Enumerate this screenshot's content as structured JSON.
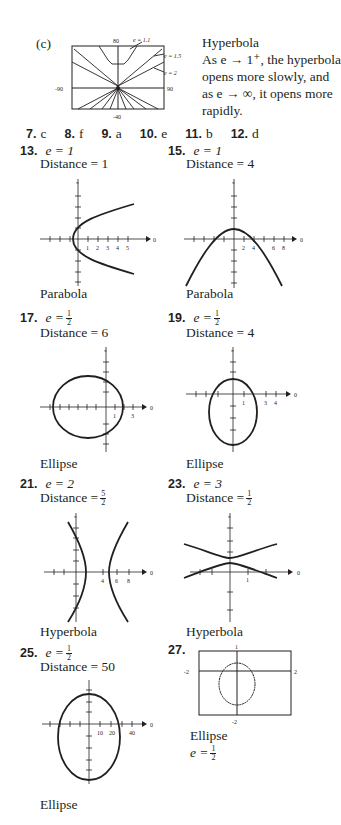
{
  "top": {
    "label": "(c)",
    "graph": {
      "ymax": "80",
      "ymin": "-40",
      "xmin": "-90",
      "xmax": "90",
      "labels": [
        "e = 1.1",
        "e = 1.5",
        "e = 2"
      ]
    },
    "title": "Hyperbola",
    "lines": [
      "As e → 1⁺, the hyperbola",
      "opens more slowly, and",
      "as e → ∞, it opens more",
      "rapidly."
    ]
  },
  "matching": [
    {
      "num": "7.",
      "ans": "c"
    },
    {
      "num": "8.",
      "ans": "f"
    },
    {
      "num": "9.",
      "ans": "a"
    },
    {
      "num": "10.",
      "ans": "e"
    },
    {
      "num": "11.",
      "ans": "b"
    },
    {
      "num": "12.",
      "ans": "d"
    }
  ],
  "problems": [
    {
      "num": "13.",
      "e": "e = 1",
      "distance": "Distance = 1",
      "type": "Parabola",
      "ticks": [
        "1",
        "2",
        "3",
        "4",
        "5"
      ]
    },
    {
      "num": "15.",
      "e": "e = 1",
      "distance": "Distance = 4",
      "type": "Parabola",
      "ticks": [
        "2",
        "4",
        "6",
        "8"
      ]
    },
    {
      "num": "17.",
      "e_lhs": "e =",
      "e_num": "1",
      "e_den": "2",
      "distance": "Distance = 6",
      "type": "Ellipse",
      "ticks": [
        "1",
        "3"
      ]
    },
    {
      "num": "19.",
      "e_lhs": "e =",
      "e_num": "1",
      "e_den": "2",
      "distance": "Distance = 4",
      "type": "Ellipse",
      "ticks": [
        "1",
        "3",
        "4"
      ]
    },
    {
      "num": "21.",
      "e": "e = 2",
      "distance_lhs": "Distance =",
      "d_num": "5",
      "d_den": "2",
      "type": "Hyperbola",
      "ticks": [
        "4",
        "6",
        "8"
      ]
    },
    {
      "num": "23.",
      "e": "e = 3",
      "distance_lhs": "Distance =",
      "d_num": "1",
      "d_den": "2",
      "type": "Hyperbola",
      "ticks": [
        "1"
      ]
    },
    {
      "num": "25.",
      "e_lhs": "e =",
      "e_num": "1",
      "e_den": "2",
      "distance": "Distance = 50",
      "type": "Ellipse",
      "ticks": [
        "10",
        "20",
        "40"
      ]
    },
    {
      "num": "27.",
      "type": "Ellipse",
      "e_lhs": "e =",
      "e_num": "1",
      "e_den": "2",
      "window": {
        "ymax": "1",
        "ymin": "-2",
        "xmin": "-2",
        "xmax": "2"
      }
    }
  ],
  "axis": {
    "polar_axis_label": "0",
    "pi_num": "π",
    "pi_den": "2"
  }
}
